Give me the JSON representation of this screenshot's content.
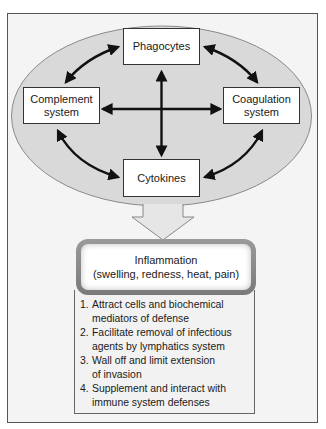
{
  "diagram": {
    "nodes": {
      "phagocytes": "Phagocytes",
      "complement_line1": "Complement",
      "complement_line2": "system",
      "coagulation_line1": "Coagulation",
      "coagulation_line2": "system",
      "cytokines": "Cytokines"
    },
    "edges": [
      {
        "from": "Phagocytes",
        "to": "Complement system",
        "bidirectional": true
      },
      {
        "from": "Phagocytes",
        "to": "Coagulation system",
        "bidirectional": true
      },
      {
        "from": "Complement system",
        "to": "Cytokines",
        "bidirectional": true
      },
      {
        "from": "Coagulation system",
        "to": "Cytokines",
        "bidirectional": true
      },
      {
        "from": "Phagocytes",
        "to": "Cytokines",
        "bidirectional": true
      },
      {
        "from": "Complement system",
        "to": "Coagulation system",
        "bidirectional": true
      }
    ],
    "result": {
      "title": "Inflammation",
      "subtitle": "(swelling, redness, heat, pain)"
    },
    "functions": [
      {
        "num": "1.",
        "line1": "Attract cells and biochemical",
        "line2": "mediators of defense"
      },
      {
        "num": "2.",
        "line1": "Facilitate removal of infectious",
        "line2": "agents by lymphatics system"
      },
      {
        "num": "3.",
        "line1": "Wall off and limit extension",
        "line2": "of invasion"
      },
      {
        "num": "4.",
        "line1": "Supplement and interact with",
        "line2": "immune system defenses"
      }
    ],
    "colors": {
      "ellipse_fill": "#d9d9d9",
      "frame_bg": "#f4f4f4",
      "arrow": "#111111",
      "box_border": "#333333"
    }
  }
}
